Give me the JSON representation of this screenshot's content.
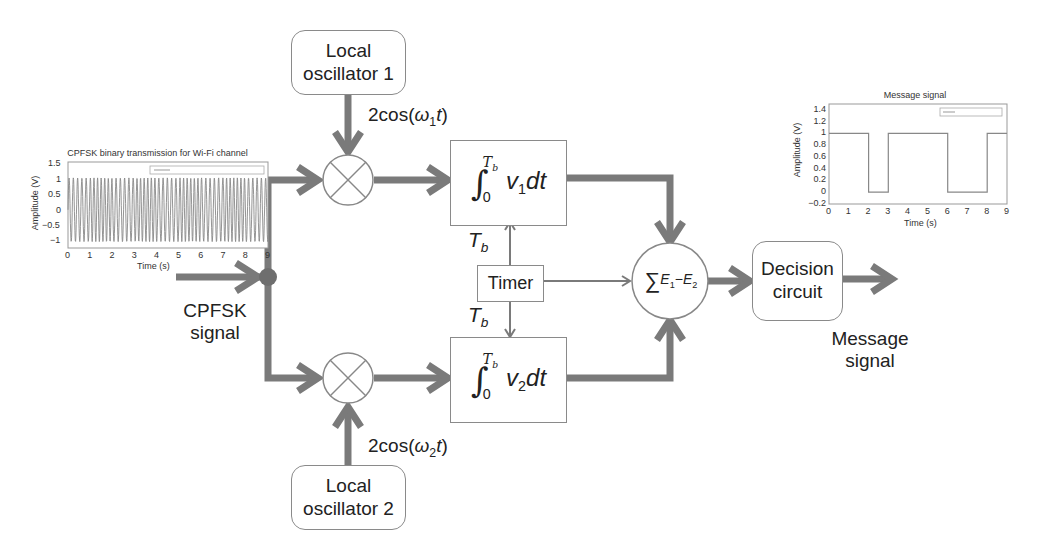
{
  "diagram": {
    "input": {
      "label_line1": "CPFSK",
      "label_line2": "signal"
    },
    "oscillator1": {
      "line1": "Local",
      "line2": "oscillator 1",
      "signal": "2cos(ω1t)",
      "sig_prefix": "2cos(",
      "sig_omega": "ω",
      "sig_sub": "1",
      "sig_t": "t",
      "sig_suffix": ")"
    },
    "oscillator2": {
      "line1": "Local",
      "line2": "oscillator 2",
      "signal": "2cos(ω2t)",
      "sig_prefix": "2cos(",
      "sig_omega": "ω",
      "sig_sub": "2",
      "sig_t": "t",
      "sig_suffix": ")"
    },
    "integrator1": {
      "upper_limit": "T",
      "upper_sub": "b",
      "lower_limit": "0",
      "var": "v",
      "var_sub": "1",
      "dt": "dt"
    },
    "integrator2": {
      "upper_limit": "T",
      "upper_sub": "b",
      "lower_limit": "0",
      "var": "v",
      "var_sub": "2",
      "dt": "dt"
    },
    "timer": {
      "label": "Timer",
      "tb_top": "T",
      "tb_top_sub": "b",
      "tb_bottom": "T",
      "tb_bottom_sub": "b"
    },
    "summer": {
      "sigma": "∑",
      "e1": "E",
      "e1_sub": "1",
      "minus": "−",
      "e2": "E",
      "e2_sub": "2"
    },
    "decision": {
      "line1": "Decision",
      "line2": "circuit"
    },
    "output": {
      "label_line1": "Message",
      "label_line2": "signal"
    },
    "colors": {
      "arrow": "#7a7a7a",
      "box_border": "#8a8a8a",
      "text": "#222222",
      "junction": "#6e6e6e"
    }
  },
  "chart_data": [
    {
      "type": "line",
      "title": "CPFSK binary transmission for Wi-Fi channel",
      "xlabel": "Time (s)",
      "ylabel": "Amplitude (V)",
      "xlim": [
        0,
        9
      ],
      "ylim": [
        -1.2,
        1.5
      ],
      "x_ticks": [
        "0",
        "1",
        "2",
        "3",
        "4",
        "5",
        "6",
        "7",
        "8",
        "9"
      ],
      "y_ticks": [
        "1.5",
        "1",
        "0.5",
        "0",
        "−0.5",
        "−1"
      ],
      "legend": "CPFSK modulated signal",
      "grid": true,
      "series": [
        {
          "name": "CPFSK signal",
          "description": "sinusoid oscillating between -1 and 1 with ~50 cycles over 0-9 s"
        }
      ]
    },
    {
      "type": "line",
      "title": "Message signal",
      "xlabel": "Time (s)",
      "ylabel": "Amplitude (V)",
      "xlim": [
        0,
        9
      ],
      "ylim": [
        -0.2,
        1.5
      ],
      "x_ticks": [
        "0",
        "1",
        "2",
        "3",
        "4",
        "5",
        "6",
        "7",
        "8",
        "9"
      ],
      "y_ticks": [
        "1.4",
        "1.2",
        "1",
        "0.8",
        "0.6",
        "0.4",
        "0.2",
        "0",
        "−0.2"
      ],
      "legend": "Binary [1 0 1 0 1]",
      "grid": true,
      "series": [
        {
          "name": "Message",
          "x": [
            0,
            2,
            2,
            3,
            3,
            6,
            6,
            8,
            8,
            9
          ],
          "y": [
            1,
            1,
            0,
            0,
            1,
            1,
            0,
            0,
            1,
            1
          ]
        }
      ]
    }
  ]
}
